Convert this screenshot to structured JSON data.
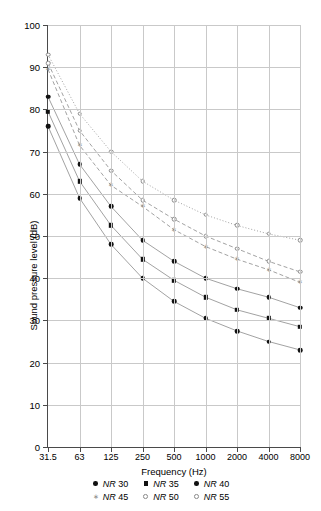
{
  "chart_data": {
    "type": "line",
    "title": "",
    "xlabel": "Frequency (Hz)",
    "ylabel": "Sound pressure level (dB)",
    "x_tick_labels": [
      "31.5",
      "63",
      "125",
      "250",
      "500",
      "1000",
      "2000",
      "4000",
      "8000"
    ],
    "x_values": [
      31.5,
      63,
      125,
      250,
      500,
      1000,
      2000,
      4000,
      8000
    ],
    "x_scale": "octave-band (log, evenly spaced)",
    "y_tick_labels": [
      "0",
      "10",
      "20",
      "30",
      "40",
      "50",
      "60",
      "70",
      "80",
      "90",
      "100"
    ],
    "ylim": [
      0,
      100
    ],
    "y_tick_step": 10,
    "grid": "both",
    "legend_position": "below-plot",
    "series": [
      {
        "name": "NR 30",
        "marker": "filled-circle",
        "line": "solid",
        "values": [
          83.0,
          67.0,
          57.0,
          49.0,
          44.0,
          40.0,
          37.5,
          35.5,
          33.0
        ]
      },
      {
        "name": "NR 35",
        "marker": "filled-square",
        "line": "solid",
        "values": [
          79.5,
          63.0,
          52.5,
          44.5,
          39.5,
          35.5,
          32.5,
          30.5,
          28.5
        ]
      },
      {
        "name": "NR 40",
        "marker": "filled-circle",
        "line": "solid",
        "values": [
          76.0,
          59.0,
          48.0,
          40.0,
          34.5,
          30.5,
          27.5,
          25.0,
          23.0
        ]
      },
      {
        "name": "NR 45",
        "marker": "star",
        "line": "dashed",
        "values": [
          89.5,
          71.5,
          62.0,
          57.0,
          51.5,
          47.5,
          44.5,
          42.0,
          39.0
        ]
      },
      {
        "name": "NR 50",
        "marker": "open-circle",
        "line": "dashed",
        "values": [
          91.0,
          75.0,
          65.5,
          58.5,
          54.0,
          50.0,
          47.0,
          44.0,
          41.5
        ]
      },
      {
        "name": "NR 55",
        "marker": "open-circle",
        "line": "dotted",
        "values": [
          93.0,
          79.0,
          70.0,
          63.0,
          58.5,
          55.0,
          52.5,
          50.5,
          49.0
        ]
      }
    ]
  },
  "legend": {
    "rows": [
      [
        {
          "label": "NR 30"
        },
        {
          "label": "NR 35"
        },
        {
          "label": "NR 40"
        }
      ],
      [
        {
          "label": "NR 45"
        },
        {
          "label": "NR 50"
        },
        {
          "label": "NR 55"
        }
      ]
    ]
  },
  "colors": {
    "axis": "#4a4a4a",
    "grid": "#c9c9c9",
    "dark_series": "#111111",
    "light_series": "#8a8a8a",
    "background": "#ffffff"
  }
}
